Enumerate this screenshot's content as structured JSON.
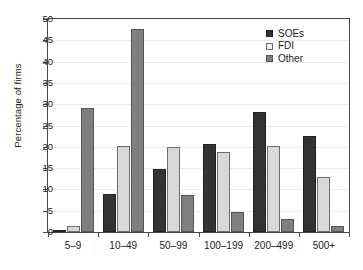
{
  "chart_data": {
    "type": "bar",
    "title": "",
    "subtitle": "",
    "xlabel": "",
    "ylabel": "Percentage of firms",
    "categories": [
      "5–9",
      "10–49",
      "50–99",
      "100–199",
      "200–499",
      "500+"
    ],
    "series": [
      {
        "name": "SOEs",
        "color": "#333333",
        "values": [
          0.5,
          8.9,
          14.9,
          20.6,
          28.2,
          22.5
        ]
      },
      {
        "name": "FDI",
        "color": "#d9d9d9",
        "values": [
          1.4,
          20.2,
          19.9,
          18.8,
          20.3,
          12.9
        ]
      },
      {
        "name": "Other",
        "color": "#7f7f7f",
        "values": [
          29.0,
          47.6,
          8.8,
          4.8,
          3.1,
          1.3
        ]
      }
    ],
    "ylim": [
      0,
      50
    ],
    "yticks": [
      0,
      5,
      10,
      15,
      20,
      25,
      30,
      35,
      40,
      45,
      50
    ],
    "ytick_labels": [
      "0",
      "5",
      "10",
      "15",
      "20",
      "25",
      "30",
      "35",
      "40",
      "45",
      "50"
    ],
    "grid": true,
    "grid_axis": "y",
    "legend_position": "top-right",
    "legend_entries": [
      "SOEs",
      "FDI",
      "Other"
    ]
  }
}
